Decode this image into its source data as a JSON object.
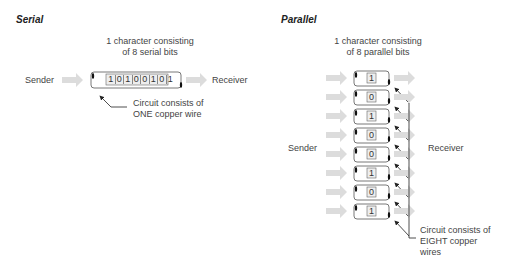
{
  "serial": {
    "title": "Serial",
    "caption_line1": "1 character consisting",
    "caption_line2": "of 8 serial bits",
    "sender": "Sender",
    "receiver": "Receiver",
    "bits": [
      "1",
      "0",
      "1",
      "0",
      "0",
      "1",
      "0",
      "1"
    ],
    "note_line1": "Circuit consists of",
    "note_line2": "ONE copper wire"
  },
  "parallel": {
    "title": "Parallel",
    "caption_line1": "1 character consisting",
    "caption_line2": "of 8 parallel bits",
    "sender": "Sender",
    "receiver": "Receiver",
    "bits": [
      "1",
      "0",
      "1",
      "0",
      "0",
      "1",
      "0",
      "1"
    ],
    "note_line1": "Circuit consists of",
    "note_line2": "EIGHT copper",
    "note_line3": "wires"
  },
  "colors": {
    "arrow": "#dcdcdc",
    "wire_outline": "#555555",
    "text": "#444444"
  }
}
